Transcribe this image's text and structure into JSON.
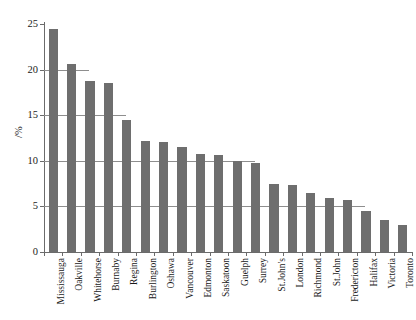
{
  "chart_data": {
    "type": "bar",
    "title": "",
    "xlabel": "",
    "ylabel": "/%",
    "ylim": [
      0,
      25
    ],
    "yticks": [
      0,
      5,
      10,
      15,
      20,
      25
    ],
    "ytick_labels": [
      "0",
      "5",
      "10",
      "15",
      "20",
      "25"
    ],
    "grid": "horizontal-partial",
    "legend": "none",
    "bar_color": "#6e6e6e",
    "axis_color": "#6b6b6b",
    "gridline_color": "#8e8e8e",
    "categories": [
      "Mississauga",
      "Oakville",
      "Whitehorse",
      "Burnaby",
      "Regina",
      "Burlington",
      "Oshawa",
      "Vancouver",
      "Edmonton",
      "Saskatoon",
      "Guelph",
      "Surrey",
      "St.John's",
      "London",
      "Richmond",
      "St.John",
      "Fredericton",
      "Halifax",
      "Victoria",
      "Toronto"
    ],
    "values": [
      24.5,
      20.6,
      18.8,
      18.5,
      14.5,
      12.2,
      12.1,
      11.5,
      10.8,
      10.6,
      10.0,
      9.8,
      7.5,
      7.3,
      6.5,
      5.9,
      5.7,
      4.5,
      3.5,
      3.0
    ]
  }
}
